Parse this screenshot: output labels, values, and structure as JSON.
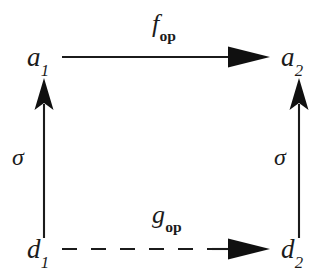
{
  "figure": {
    "kind": "commutative-diagram",
    "shape": "square",
    "background_color": "#ffffff",
    "ink_color": "#1b1b1b"
  },
  "nodes": [
    {
      "id": "a1",
      "base": "a",
      "subscript": "1",
      "position": "top-left"
    },
    {
      "id": "a2",
      "base": "a",
      "subscript": "2",
      "position": "top-right"
    },
    {
      "id": "d1",
      "base": "d",
      "subscript": "1",
      "position": "bottom-left"
    },
    {
      "id": "d2",
      "base": "d",
      "subscript": "2",
      "position": "bottom-right"
    }
  ],
  "arrows": [
    {
      "id": "f-op",
      "base": "f",
      "subscript": "op",
      "from": "a1",
      "to": "a2",
      "direction": "right",
      "style": "solid",
      "head": "solid-triangle",
      "label_position": "above"
    },
    {
      "id": "g-op",
      "base": "g",
      "subscript": "op",
      "from": "d1",
      "to": "d2",
      "direction": "right",
      "style": "dashed",
      "head": "solid-triangle",
      "label_position": "above"
    },
    {
      "id": "sigma-left",
      "base": "σ",
      "subscript": "",
      "from": "d1",
      "to": "a1",
      "direction": "up",
      "style": "solid",
      "head": "solid-triangle",
      "label_position": "left"
    },
    {
      "id": "sigma-right",
      "base": "σ",
      "subscript": "",
      "from": "d2",
      "to": "a2",
      "direction": "up",
      "style": "solid",
      "head": "solid-triangle",
      "label_position": "left"
    }
  ]
}
